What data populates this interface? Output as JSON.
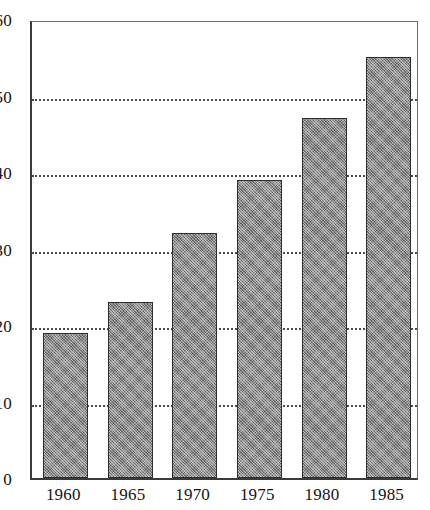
{
  "chart_data": {
    "type": "bar",
    "title": "",
    "subtitle": "",
    "xlabel": "",
    "ylabel": "",
    "categories": [
      "1960",
      "1965",
      "1970",
      "1975",
      "1980",
      "1985"
    ],
    "values": [
      19,
      23,
      32,
      39,
      47,
      55
    ],
    "ylim": [
      0,
      60
    ],
    "yticks": [
      0,
      10,
      20,
      30,
      40,
      50,
      60
    ],
    "ytick_labels": [
      "0",
      "10",
      "20",
      "30",
      "40",
      "50",
      "60"
    ],
    "gridlines_at": [
      10,
      20,
      30,
      40,
      50
    ],
    "grid": "horizontal-dotted",
    "legend": "none",
    "bar_fill_color": "#7b7b7b",
    "bar_border_color": "#2e2e2e",
    "axis_color": "#3a3a3a",
    "grid_color": "#4a4a4a",
    "background_color": "#ffffff"
  }
}
